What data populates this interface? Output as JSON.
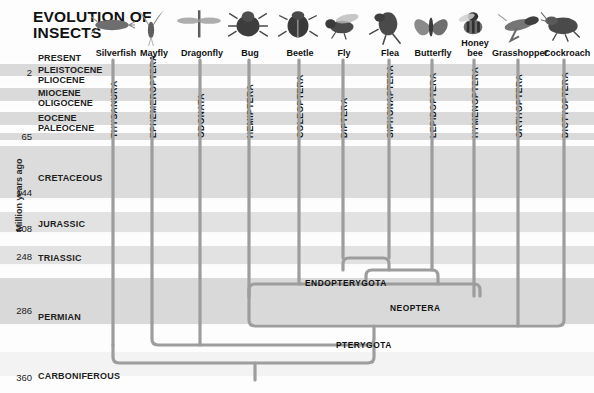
{
  "title": {
    "line1": "EVOLUTION OF",
    "line2": "INSECTS"
  },
  "axis": {
    "label": "Million years ago",
    "ticks": [
      {
        "value": "2",
        "y": 72
      },
      {
        "value": "65",
        "y": 136
      },
      {
        "value": "144",
        "y": 192
      },
      {
        "value": "208",
        "y": 228
      },
      {
        "value": "248",
        "y": 256
      },
      {
        "value": "286",
        "y": 310
      },
      {
        "value": "360",
        "y": 377
      }
    ]
  },
  "epochs": [
    {
      "label": "PRESENT",
      "y": 58,
      "shade": false
    },
    {
      "label": "PLEISTOCENE",
      "y": 70,
      "shade": true
    },
    {
      "label": "PLIOCENE",
      "y": 80,
      "shade": true
    },
    {
      "label": "MIOCENE",
      "y": 93,
      "shade": true
    },
    {
      "label": "OLIGOCENE",
      "y": 103,
      "shade": true
    },
    {
      "label": "EOCENE",
      "y": 118,
      "shade": true
    },
    {
      "label": "PALEOCENE",
      "y": 128,
      "shade": true
    }
  ],
  "periods": [
    {
      "label": "CRETACEOUS",
      "y": 178
    },
    {
      "label": "JURASSIC",
      "y": 224
    },
    {
      "label": "TRIASSIC",
      "y": 258
    },
    {
      "label": "PERMIAN",
      "y": 317
    },
    {
      "label": "CARBONIFEROUS",
      "y": 376
    }
  ],
  "taxa": [
    {
      "common": "Silverfish",
      "order": "THYSANURA",
      "x": 113,
      "icon": "silverfish-icon",
      "common_x": 92,
      "common_w": 48,
      "order_top": 72,
      "branch_top": 60,
      "branch_bottom": 363
    },
    {
      "common": "Mayfly",
      "order": "EPHEMEROPTERA",
      "x": 152,
      "icon": "mayfly-icon",
      "common_x": 132,
      "common_w": 44,
      "order_top": 72,
      "branch_top": 60,
      "branch_bottom": 345
    },
    {
      "common": "Dragonfly",
      "order": "ODONATA",
      "x": 200,
      "icon": "dragonfly-icon",
      "common_x": 176,
      "common_w": 52,
      "order_top": 72,
      "branch_top": 60,
      "branch_bottom": 345
    },
    {
      "common": "Bug",
      "order": "HEMIPTERA",
      "x": 249,
      "icon": "bug-icon",
      "common_x": 228,
      "common_w": 44,
      "order_top": 72,
      "branch_top": 60,
      "branch_bottom": 325
    },
    {
      "common": "Beetle",
      "order": "COLEOPTERA",
      "x": 299,
      "icon": "beetle-icon",
      "common_x": 276,
      "common_w": 48,
      "order_top": 72,
      "branch_top": 60,
      "branch_bottom": 283
    },
    {
      "common": "Fly",
      "order": "DIPTERA",
      "x": 343,
      "icon": "fly-icon",
      "common_x": 322,
      "common_w": 44,
      "order_top": 72,
      "branch_top": 60,
      "branch_bottom": 270
    },
    {
      "common": "Flea",
      "order": "SIPHONAPTERA",
      "x": 389,
      "icon": "flea-icon",
      "common_x": 368,
      "common_w": 44,
      "order_top": 72,
      "branch_top": 60,
      "branch_bottom": 270
    },
    {
      "common": "Butterfly",
      "order": "LEPIDOPTERA",
      "x": 432,
      "icon": "butterfly-icon",
      "common_x": 406,
      "common_w": 54,
      "order_top": 72,
      "branch_top": 60,
      "branch_bottom": 277
    },
    {
      "common": "Honey\nbee",
      "order": "HYMENOPTERA",
      "x": 474,
      "icon": "honeybee-icon",
      "common_x": 455,
      "common_w": 40,
      "order_top": 72,
      "branch_top": 60,
      "branch_bottom": 292
    },
    {
      "common": "Grasshopper",
      "order": "ORTHOPTERA",
      "x": 518,
      "icon": "grasshopper-icon",
      "common_x": 490,
      "common_w": 60,
      "order_top": 72,
      "branch_top": 60,
      "branch_bottom": 307
    },
    {
      "common": "Cockroach",
      "order": "DICTYOPTERA",
      "x": 564,
      "icon": "cockroach-icon",
      "common_x": 540,
      "common_w": 54,
      "order_top": 72,
      "branch_top": 60,
      "branch_bottom": 300
    }
  ],
  "clades": [
    {
      "label": "ENDOPTERYGOTA",
      "x": 305,
      "y": 283
    },
    {
      "label": "NEOPTERA",
      "x": 390,
      "y": 308
    },
    {
      "label": "PTERYGOTA",
      "x": 336,
      "y": 345
    }
  ],
  "colors": {
    "band_dark": "#d5d5d5",
    "band_mid": "#e3e3e3",
    "band_light": "#efefef",
    "page": "#fdfdfd",
    "branch": "#9b9b9b",
    "text": "#111111"
  }
}
